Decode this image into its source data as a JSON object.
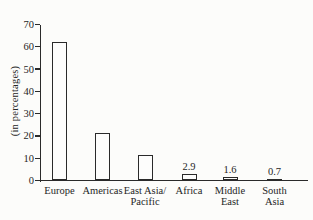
{
  "figure": {
    "background": "#fcfcfa",
    "line_color": "#2a2a2a",
    "bar_fill": "#fdfdfc"
  },
  "chart_data": {
    "type": "bar",
    "title": "",
    "xlabel": "",
    "ylabel": "(in percentages)",
    "ylim": [
      0,
      70
    ],
    "yticks": [
      0,
      10,
      20,
      30,
      40,
      50,
      60,
      70
    ],
    "grid": false,
    "legend_position": "none",
    "categories": [
      "Europe",
      "Americas",
      "East Asia/ Pacific",
      "Africa",
      "Middle East",
      "South Asia"
    ],
    "category_label_lines": [
      [
        "Europe"
      ],
      [
        "Americas"
      ],
      [
        "East Asia/",
        "Pacific"
      ],
      [
        "Africa"
      ],
      [
        "Middle",
        "East"
      ],
      [
        "South",
        "Asia"
      ]
    ],
    "values": [
      62,
      21.5,
      11.5,
      2.9,
      1.6,
      0.7
    ],
    "bar_value_labels": [
      "",
      "",
      "",
      "2.9",
      "1.6",
      "0.7"
    ]
  }
}
